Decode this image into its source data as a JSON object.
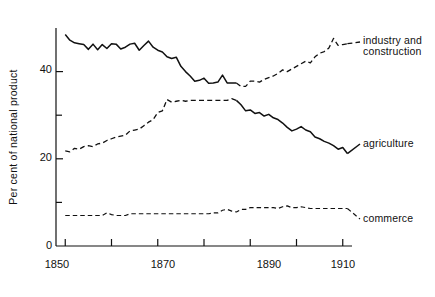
{
  "chart_data": {
    "type": "line",
    "title": "",
    "subtitle": "",
    "xlabel": "",
    "ylabel": "Per cent of national product",
    "xlim": [
      1848,
      1912
    ],
    "ylim": [
      0,
      50
    ],
    "grid": false,
    "legend_position": "right-inline",
    "x_ticks_major": [
      1850,
      1870,
      1890,
      1910
    ],
    "x_ticks_minor": [
      1860,
      1880,
      1900
    ],
    "y_ticks_major": [
      0,
      20,
      40
    ],
    "y_ticks_minor": [
      10,
      30
    ],
    "x_tick_labels": [
      "1850",
      "1870",
      "1890",
      "1910"
    ],
    "y_tick_labels": [
      "0",
      "20",
      "40"
    ],
    "series": [
      {
        "name": "industry and construction",
        "label": "industry and construction",
        "color": "#111111",
        "style_before_crossover": "solid",
        "style_after_crossover": "dashed",
        "crossover_year": 1887,
        "x": [
          1850,
          1851,
          1852,
          1853,
          1854,
          1855,
          1856,
          1857,
          1858,
          1859,
          1860,
          1861,
          1862,
          1863,
          1864,
          1865,
          1866,
          1867,
          1868,
          1869,
          1870,
          1871,
          1872,
          1873,
          1874,
          1875,
          1876,
          1877,
          1878,
          1879,
          1880,
          1881,
          1882,
          1883,
          1884,
          1885,
          1886,
          1887,
          1888,
          1889,
          1890,
          1891,
          1892,
          1893,
          1894,
          1895,
          1896,
          1897,
          1898,
          1899,
          1900,
          1901,
          1902,
          1903,
          1904,
          1905,
          1906,
          1907,
          1908,
          1909,
          1910,
          1911
        ],
        "values": [
          48.5,
          47.2,
          46.6,
          46.4,
          46.2,
          45.1,
          46.3,
          45.0,
          46.2,
          45.3,
          46.4,
          46.3,
          45.2,
          45.6,
          46.3,
          46.5,
          44.9,
          46.0,
          47.0,
          45.6,
          44.9,
          44.5,
          43.4,
          43.0,
          43.3,
          41.2,
          40.0,
          39.0,
          37.8,
          38.0,
          38.5,
          37.3,
          37.4,
          37.6,
          39.2,
          37.4,
          37.4,
          37.4,
          36.6,
          36.6,
          37.8,
          37.8,
          37.6,
          38.2,
          38.6,
          39.0,
          39.6,
          40.4,
          40.0,
          40.6,
          41.2,
          41.8,
          42.4,
          42.0,
          43.4,
          44.2,
          44.6,
          45.4,
          47.6,
          46.0,
          46.2,
          46.4
        ]
      },
      {
        "name": "agriculture",
        "label": "agriculture",
        "color": "#111111",
        "style_before_crossover": "dashed",
        "style_after_crossover": "solid",
        "crossover_year": 1887,
        "x": [
          1850,
          1851,
          1852,
          1853,
          1854,
          1855,
          1856,
          1857,
          1858,
          1859,
          1860,
          1861,
          1862,
          1863,
          1864,
          1865,
          1866,
          1867,
          1868,
          1869,
          1870,
          1871,
          1872,
          1873,
          1874,
          1875,
          1876,
          1877,
          1878,
          1879,
          1880,
          1881,
          1882,
          1883,
          1884,
          1885,
          1886,
          1887,
          1888,
          1889,
          1890,
          1891,
          1892,
          1893,
          1894,
          1895,
          1896,
          1897,
          1898,
          1899,
          1900,
          1901,
          1902,
          1903,
          1904,
          1905,
          1906,
          1907,
          1908,
          1909,
          1910,
          1911
        ],
        "values": [
          21.8,
          21.6,
          22.4,
          22.2,
          22.8,
          23.0,
          22.8,
          23.4,
          23.6,
          24.2,
          24.6,
          25.0,
          25.2,
          25.4,
          26.4,
          26.6,
          26.8,
          27.6,
          28.4,
          29.0,
          30.6,
          31.0,
          33.6,
          33.0,
          33.2,
          33.4,
          33.2,
          33.4,
          33.4,
          33.4,
          33.4,
          33.4,
          33.4,
          33.4,
          33.4,
          33.4,
          33.8,
          33.4,
          32.4,
          31.0,
          31.2,
          30.4,
          30.6,
          29.8,
          30.2,
          29.4,
          29.0,
          28.2,
          27.2,
          26.4,
          26.8,
          27.4,
          26.6,
          26.2,
          25.0,
          24.6,
          24.0,
          23.6,
          23.0,
          22.2,
          22.6,
          21.2
        ]
      },
      {
        "name": "commerce",
        "label": "commerce",
        "color": "#111111",
        "style": "dashed",
        "x": [
          1850,
          1851,
          1852,
          1853,
          1854,
          1855,
          1856,
          1857,
          1858,
          1859,
          1860,
          1861,
          1862,
          1863,
          1864,
          1865,
          1866,
          1867,
          1868,
          1869,
          1870,
          1871,
          1872,
          1873,
          1874,
          1875,
          1876,
          1877,
          1878,
          1879,
          1880,
          1881,
          1882,
          1883,
          1884,
          1885,
          1886,
          1887,
          1888,
          1889,
          1890,
          1891,
          1892,
          1893,
          1894,
          1895,
          1896,
          1897,
          1898,
          1899,
          1900,
          1901,
          1902,
          1903,
          1904,
          1905,
          1906,
          1907,
          1908,
          1909,
          1910,
          1911
        ],
        "values": [
          7.0,
          7.0,
          7.0,
          7.0,
          7.0,
          7.0,
          7.0,
          7.0,
          7.0,
          7.6,
          7.2,
          7.0,
          7.0,
          7.0,
          7.4,
          7.4,
          7.4,
          7.4,
          7.4,
          7.4,
          7.4,
          7.4,
          7.4,
          7.4,
          7.4,
          7.4,
          7.4,
          7.4,
          7.4,
          7.4,
          7.4,
          7.4,
          7.6,
          7.6,
          8.2,
          8.4,
          8.0,
          7.8,
          8.4,
          8.4,
          8.8,
          8.8,
          8.8,
          8.8,
          8.8,
          8.8,
          8.6,
          9.0,
          9.2,
          8.8,
          8.8,
          9.0,
          8.8,
          8.6,
          8.6,
          8.6,
          8.6,
          8.6,
          8.6,
          8.6,
          8.6,
          8.6
        ]
      }
    ]
  },
  "axis": {
    "y_label": "Per cent of national product",
    "y_tick_0": "0",
    "y_tick_20": "20",
    "y_tick_40": "40",
    "x_tick_1850": "1850",
    "x_tick_1870": "1870",
    "x_tick_1890": "1890",
    "x_tick_1910": "1910"
  },
  "labels": {
    "industry_line1": "industry and",
    "industry_line2": "construction",
    "agriculture": "agriculture",
    "commerce": "commerce"
  },
  "colors": {
    "line": "#111111",
    "axis": "#111111",
    "background": "#ffffff"
  }
}
